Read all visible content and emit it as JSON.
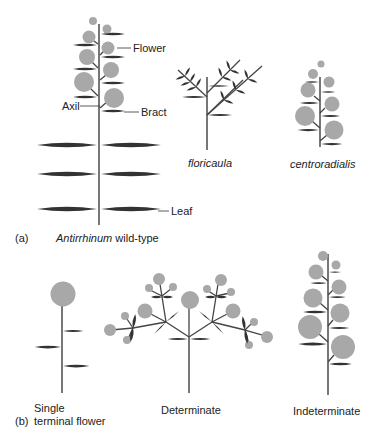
{
  "figure": {
    "panel_a": {
      "panel_label": "(a)",
      "caption_italic": "Antirrhinum",
      "caption_rest": " wild-type",
      "callouts": {
        "flower": "Flower",
        "axil": "Axil",
        "bract": "Bract",
        "leaf": "Leaf"
      },
      "mutants": [
        {
          "name": "floricaula"
        },
        {
          "name": "centroradialis"
        }
      ]
    },
    "panel_b": {
      "panel_label": "(b)",
      "types": [
        {
          "line1": "Single",
          "line2": "terminal flower"
        },
        {
          "line1": "Determinate"
        },
        {
          "line1": "Indeterminate"
        }
      ]
    },
    "colors": {
      "flower": "#a8a8a8",
      "leaf": "#333333",
      "stem": "#555555",
      "background": "#ffffff"
    }
  }
}
